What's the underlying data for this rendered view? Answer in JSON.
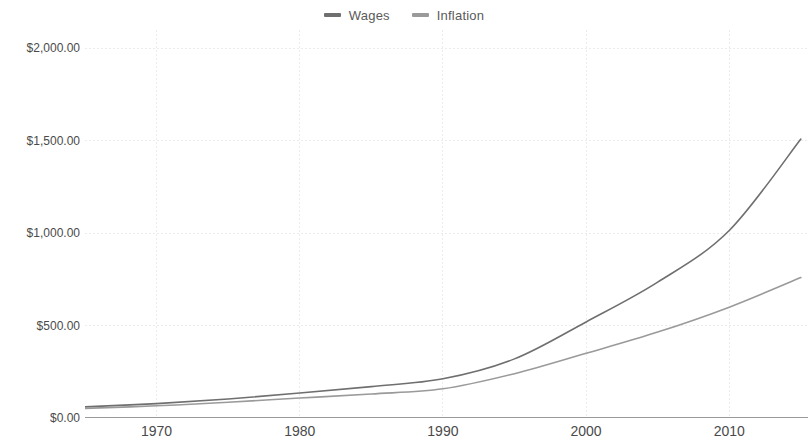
{
  "chart_data": {
    "type": "line",
    "title": "",
    "subtitle": "",
    "xlabel": "",
    "ylabel": "",
    "xlim": [
      1965,
      2015.5
    ],
    "ylim": [
      0,
      2100
    ],
    "grid": true,
    "legend_position": "top-center",
    "x_ticks": [
      "1970",
      "1980",
      "1990",
      "2000",
      "2010"
    ],
    "x_tick_values": [
      1970,
      1980,
      1990,
      2000,
      2010
    ],
    "y_ticks": [
      "$0.00",
      "$500.00",
      "$1,000.00",
      "$1,500.00",
      "$2,000.00"
    ],
    "y_tick_values": [
      0,
      500,
      1000,
      1500,
      2000
    ],
    "x": [
      1965,
      1970,
      1975,
      1980,
      1985,
      1990,
      1995,
      2000,
      2005,
      2010,
      2015
    ],
    "series": [
      {
        "name": "Wages",
        "color": "#6f6f6f",
        "values": [
          60,
          78,
          103,
          135,
          170,
          212,
          320,
          520,
          735,
          1015,
          1510
        ]
      },
      {
        "name": "Inflation",
        "color": "#9a9a9a",
        "values": [
          52,
          66,
          85,
          108,
          130,
          158,
          240,
          350,
          465,
          600,
          760
        ]
      }
    ],
    "colors": {
      "background": "#ffffff",
      "grid": "#ececec",
      "axis": "#9a9a9a",
      "text": "#4a4a4a"
    }
  },
  "legend": {
    "items": [
      {
        "label": "Wages",
        "color": "#6f6f6f"
      },
      {
        "label": "Inflation",
        "color": "#9a9a9a"
      }
    ]
  }
}
